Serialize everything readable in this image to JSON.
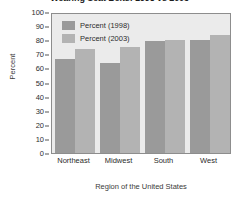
{
  "chart_data": {
    "type": "bar",
    "title": "Wearing Seat Belts: 1998 vs 2003",
    "categories": [
      "Northeast",
      "Midwest",
      "South",
      "West"
    ],
    "series": [
      {
        "name": "Percent (1998)",
        "values": [
          66.5,
          64,
          79.5,
          80
        ],
        "color": "#9a9a9a"
      },
      {
        "name": "Percent (2003)",
        "values": [
          74,
          75,
          80,
          84
        ],
        "color": "#b3b3b3"
      }
    ],
    "xlabel": "Region of the United States",
    "ylabel": "Percent",
    "ylim": [
      0,
      100
    ],
    "yticks": [
      0,
      10,
      20,
      30,
      40,
      50,
      60,
      70,
      80,
      90,
      100
    ],
    "grid": false,
    "legend_position": "top-left-inside",
    "plot_background": "#ebebeb",
    "frame_color": "#8d8d8d"
  }
}
